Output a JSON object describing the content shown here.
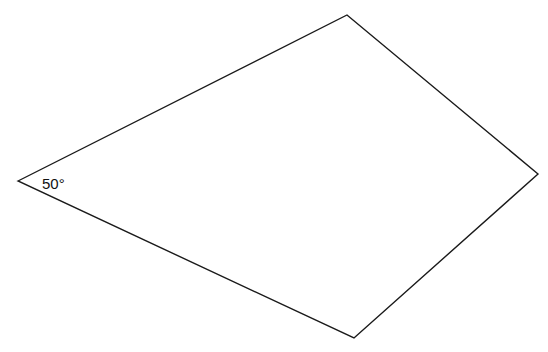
{
  "diagram": {
    "type": "quadrilateral",
    "stroke_color": "#1a1a1a",
    "fill_color": "#ffffff",
    "vertices": {
      "left": [
        18,
        181
      ],
      "top": [
        347,
        15
      ],
      "right": [
        538,
        174
      ],
      "bottom": [
        354,
        338
      ]
    },
    "points": "18,181 347,15 538,174 354,338",
    "angle_label": {
      "vertex": "left",
      "text": "50°"
    }
  }
}
